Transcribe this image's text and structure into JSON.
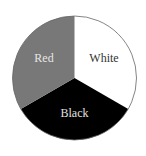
{
  "chart_data": {
    "type": "pie",
    "title": "",
    "categories": [
      "White",
      "Black",
      "Red"
    ],
    "values": [
      33.33,
      33.33,
      33.33
    ],
    "colors": [
      "#ffffff",
      "#000000",
      "#787878"
    ],
    "label_colors": [
      "#333333",
      "#e0e0e0",
      "#e6e6e6"
    ],
    "start_angle_deg": -90,
    "direction": "clockwise",
    "legend": "none",
    "labels_inside": true,
    "outline_color": "#666666"
  },
  "labels": {
    "white": "White",
    "black": "Black",
    "red": "Red"
  }
}
